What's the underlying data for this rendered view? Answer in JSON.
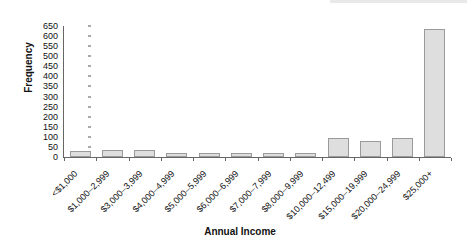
{
  "chart_data": {
    "type": "bar",
    "title": "",
    "xlabel": "Annual Income",
    "ylabel": "Frequency",
    "ylim": [
      0,
      650
    ],
    "ytick_step": 50,
    "grid": false,
    "legend": null,
    "categories": [
      "<$1,000",
      "$1,000–2,999",
      "$3,000–3,999",
      "$4,000–4,999",
      "$5,000–5,999",
      "$6,000–6,999",
      "$7,000–7,999",
      "$8,000–9,999",
      "$10,000–12,499",
      "$15,000–19,999",
      "$20,000–24,999",
      "$25,000+"
    ],
    "values": [
      28,
      34,
      33,
      21,
      19,
      22,
      21,
      20,
      95,
      78,
      93,
      637
    ],
    "ytick_labels": [
      "650",
      "600",
      "550",
      "500",
      "450",
      "400",
      "350",
      "300",
      "250",
      "200",
      "150",
      "100",
      "50",
      "0"
    ],
    "ytick_values": [
      650,
      600,
      550,
      500,
      450,
      400,
      350,
      300,
      250,
      200,
      150,
      100,
      50,
      0
    ],
    "bar_fill_color": "#dedede",
    "bar_border_color": "#9a9a9a",
    "axis_color": "#666666",
    "text_color": "#111111"
  }
}
